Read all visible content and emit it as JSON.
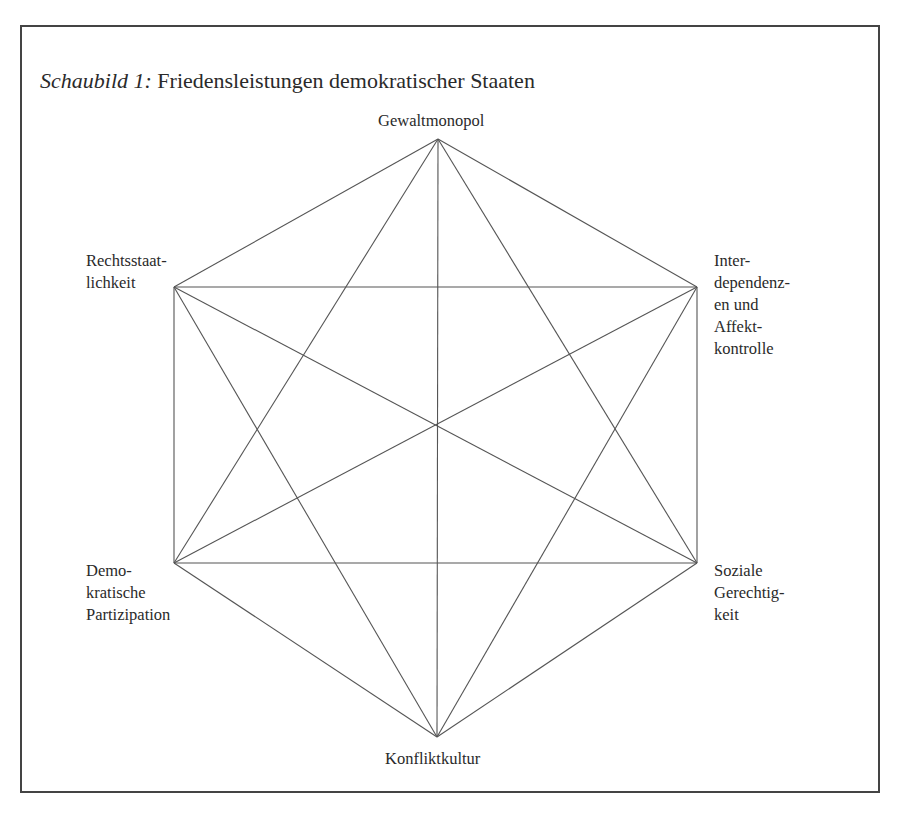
{
  "figure": {
    "caption_prefix": "Schaubild 1:",
    "caption_title": "Friedensleistungen demokratischer Staaten"
  },
  "nodes": [
    {
      "id": "gewaltmonopol",
      "label": "Gewaltmonopol",
      "x": 438,
      "y": 139
    },
    {
      "id": "interdependenzen",
      "label": "Inter-\ndependenz-\nen und\nAffekt-\nkontrolle",
      "x": 697,
      "y": 287
    },
    {
      "id": "soziale-gerechtigkeit",
      "label": "Soziale\nGerechtig-\nkeit",
      "x": 697,
      "y": 563
    },
    {
      "id": "konfliktkultur",
      "label": "Konfliktkultur",
      "x": 437,
      "y": 737
    },
    {
      "id": "demokratische-partizipation",
      "label": "Demo-\nkratische\nPartizipation",
      "x": 174,
      "y": 563
    },
    {
      "id": "rechtsstaatlichkeit",
      "label": "Rechtsstaat-\nlichkeit",
      "x": 174,
      "y": 287
    }
  ],
  "edges": "all pairs connected (complete graph of 6 nodes)",
  "colors": {
    "line": "#555555",
    "text": "#2a2a2a",
    "frame": "#444444"
  }
}
